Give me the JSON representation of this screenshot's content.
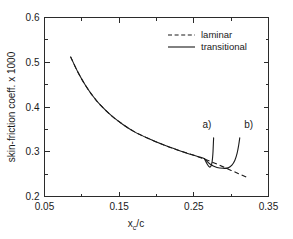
{
  "chart_data": {
    "type": "line",
    "title": "",
    "xlabel": "x_c/c",
    "xlabel_main": "x",
    "xlabel_sub": "c",
    "xlabel_tail": "/c",
    "ylabel": "skin-friction coeff. x 1000",
    "xlim": [
      0.05,
      0.35
    ],
    "ylim": [
      0.2,
      0.6
    ],
    "xticks": [
      0.05,
      0.15,
      0.25,
      0.35
    ],
    "xtick_labels": [
      "0.05",
      "0.15",
      "0.25",
      "0.35"
    ],
    "xminorticks": [
      0.1,
      0.2,
      0.3
    ],
    "yticks": [
      0.2,
      0.3,
      0.4,
      0.5,
      0.6
    ],
    "ytick_labels": [
      "0.2",
      "0.3",
      "0.4",
      "0.5",
      "0.6"
    ],
    "yminorticks": [
      0.25,
      0.35,
      0.45,
      0.55
    ],
    "grid": false,
    "legend_position": "upper-right",
    "series": [
      {
        "name": "laminar",
        "style": "dashed",
        "x": [
          0.085,
          0.095,
          0.105,
          0.115,
          0.125,
          0.14,
          0.155,
          0.17,
          0.19,
          0.21,
          0.23,
          0.25,
          0.265,
          0.28,
          0.295,
          0.31,
          0.322
        ],
        "values": [
          0.512,
          0.477,
          0.448,
          0.424,
          0.404,
          0.38,
          0.361,
          0.345,
          0.329,
          0.315,
          0.303,
          0.292,
          0.283,
          0.273,
          0.262,
          0.251,
          0.242
        ]
      },
      {
        "name": "transitional",
        "style": "solid",
        "x": [
          0.085,
          0.095,
          0.105,
          0.115,
          0.125,
          0.14,
          0.155,
          0.17,
          0.19,
          0.21,
          0.23,
          0.25,
          0.258,
          0.264
        ],
        "values": [
          0.512,
          0.477,
          0.448,
          0.424,
          0.404,
          0.38,
          0.361,
          0.345,
          0.329,
          0.315,
          0.303,
          0.292,
          0.288,
          0.285
        ]
      },
      {
        "name": "transitional-branch-a",
        "style": "solid",
        "x": [
          0.264,
          0.268,
          0.271,
          0.273,
          0.2745,
          0.2755,
          0.276,
          0.2765
        ],
        "values": [
          0.285,
          0.272,
          0.266,
          0.268,
          0.278,
          0.295,
          0.312,
          0.331
        ]
      },
      {
        "name": "transitional-branch-b",
        "style": "solid",
        "x": [
          0.264,
          0.272,
          0.281,
          0.289,
          0.296,
          0.301,
          0.305,
          0.308,
          0.31,
          0.3115
        ],
        "values": [
          0.285,
          0.272,
          0.265,
          0.263,
          0.264,
          0.27,
          0.281,
          0.297,
          0.314,
          0.331
        ]
      }
    ],
    "annotations": [
      {
        "text": "a)",
        "x": 0.2675,
        "y": 0.354
      },
      {
        "text": "b)",
        "x": 0.3235,
        "y": 0.354
      }
    ],
    "legend_entries": [
      {
        "label": "laminar",
        "style": "dashed"
      },
      {
        "label": "transitional",
        "style": "solid"
      }
    ]
  }
}
